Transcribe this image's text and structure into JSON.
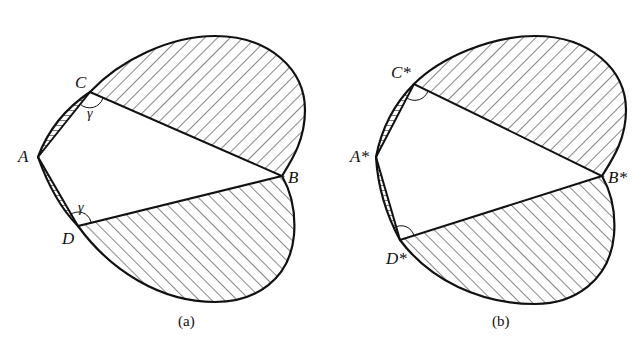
{
  "figure": {
    "panels": [
      {
        "id": "a",
        "caption": "(a)",
        "vertices": {
          "A": "A",
          "B": "B",
          "C": "C",
          "D": "D"
        },
        "angle_labels": {
          "C": "γ",
          "D": "γ"
        }
      },
      {
        "id": "b",
        "caption": "(b)",
        "vertices": {
          "A": "A*",
          "B": "B*",
          "C": "C*",
          "D": "D*"
        },
        "angle_labels": {
          "C": "",
          "D": ""
        }
      }
    ],
    "colors": {
      "stroke": "#111111",
      "hatch": "#222222",
      "background": "#ffffff"
    }
  }
}
